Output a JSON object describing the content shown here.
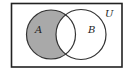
{
  "diagram": {
    "type": "venn",
    "title": "",
    "universe_label": "U",
    "sets": [
      {
        "label": "A",
        "cx": 51,
        "cy": 34.5,
        "r": 24.5
      },
      {
        "label": "B",
        "cx": 81,
        "cy": 34.5,
        "r": 25
      }
    ],
    "shaded_region": "A \\ B",
    "colors": {
      "shade": "#a9a9a9",
      "stroke": "#333333",
      "background": "#ffffff"
    }
  }
}
